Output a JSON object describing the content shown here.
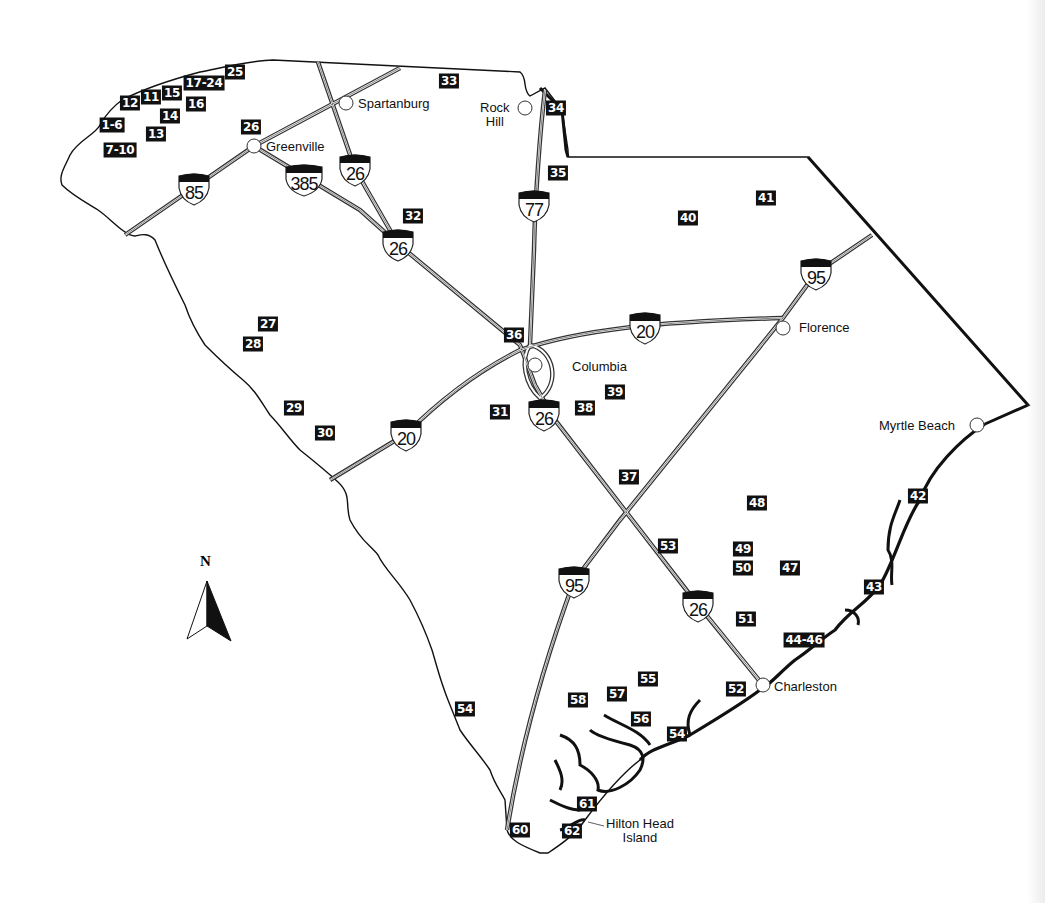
{
  "map": {
    "title": "South Carolina",
    "north_label": "N",
    "colors": {
      "marker_bg": "#111111",
      "marker_text": "#ffffff",
      "border": "#111111",
      "road": "#333333"
    },
    "cities": [
      {
        "name": "Spartanburg",
        "x": 346,
        "y": 103,
        "label_x": 358,
        "label_y": 97
      },
      {
        "name": "Rock Hill",
        "x": 525,
        "y": 108,
        "label_x": 478,
        "label_y": 101,
        "lines": [
          "Rock",
          "Hill"
        ]
      },
      {
        "name": "Greenville",
        "x": 254,
        "y": 146,
        "label_x": 266,
        "label_y": 140
      },
      {
        "name": "Florence",
        "x": 783,
        "y": 328,
        "label_x": 799,
        "label_y": 321
      },
      {
        "name": "Columbia",
        "x": 535,
        "y": 365,
        "label_x": 572,
        "label_y": 360
      },
      {
        "name": "Myrtle Beach",
        "x": 977,
        "y": 425,
        "label_x": 879,
        "label_y": 419
      },
      {
        "name": "Charleston",
        "x": 763,
        "y": 685,
        "label_x": 774,
        "label_y": 680
      },
      {
        "name": "Hilton Head Island",
        "x": 0,
        "y": 0,
        "label_x": 605,
        "label_y": 818,
        "lines": [
          "Hilton Head",
          "Island"
        ]
      }
    ],
    "interstates": [
      {
        "number": "85",
        "x": 194,
        "y": 188
      },
      {
        "number": "385",
        "x": 304,
        "y": 179
      },
      {
        "number": "26",
        "x": 355,
        "y": 169
      },
      {
        "number": "26",
        "x": 398,
        "y": 244
      },
      {
        "number": "77",
        "x": 534,
        "y": 205
      },
      {
        "number": "95",
        "x": 816,
        "y": 273
      },
      {
        "number": "20",
        "x": 645,
        "y": 327
      },
      {
        "number": "26",
        "x": 544,
        "y": 414
      },
      {
        "number": "20",
        "x": 406,
        "y": 434
      },
      {
        "number": "95",
        "x": 574,
        "y": 581
      },
      {
        "number": "26",
        "x": 698,
        "y": 605
      }
    ],
    "markers": [
      {
        "label": "25",
        "x": 235,
        "y": 72
      },
      {
        "label": "17-24",
        "x": 204,
        "y": 83
      },
      {
        "label": "15",
        "x": 172,
        "y": 93
      },
      {
        "label": "11",
        "x": 151,
        "y": 97
      },
      {
        "label": "12",
        "x": 130,
        "y": 103
      },
      {
        "label": "16",
        "x": 196,
        "y": 104
      },
      {
        "label": "14",
        "x": 170,
        "y": 116
      },
      {
        "label": "1-6",
        "x": 112,
        "y": 125
      },
      {
        "label": "13",
        "x": 156,
        "y": 134
      },
      {
        "label": "7-10",
        "x": 120,
        "y": 150
      },
      {
        "label": "26",
        "x": 251,
        "y": 127
      },
      {
        "label": "33",
        "x": 449,
        "y": 81
      },
      {
        "label": "34",
        "x": 556,
        "y": 108
      },
      {
        "label": "35",
        "x": 558,
        "y": 173
      },
      {
        "label": "32",
        "x": 413,
        "y": 216
      },
      {
        "label": "41",
        "x": 766,
        "y": 198
      },
      {
        "label": "40",
        "x": 688,
        "y": 218
      },
      {
        "label": "27",
        "x": 268,
        "y": 324
      },
      {
        "label": "28",
        "x": 253,
        "y": 344
      },
      {
        "label": "36",
        "x": 514,
        "y": 335
      },
      {
        "label": "39",
        "x": 615,
        "y": 392
      },
      {
        "label": "38",
        "x": 585,
        "y": 408
      },
      {
        "label": "31",
        "x": 500,
        "y": 412
      },
      {
        "label": "29",
        "x": 294,
        "y": 408
      },
      {
        "label": "30",
        "x": 325,
        "y": 433
      },
      {
        "label": "37",
        "x": 629,
        "y": 477
      },
      {
        "label": "48",
        "x": 757,
        "y": 503
      },
      {
        "label": "42",
        "x": 918,
        "y": 496
      },
      {
        "label": "53",
        "x": 668,
        "y": 546
      },
      {
        "label": "49",
        "x": 743,
        "y": 549
      },
      {
        "label": "50",
        "x": 743,
        "y": 568
      },
      {
        "label": "47",
        "x": 790,
        "y": 568
      },
      {
        "label": "43",
        "x": 874,
        "y": 587
      },
      {
        "label": "51",
        "x": 746,
        "y": 619
      },
      {
        "label": "44-46",
        "x": 804,
        "y": 640
      },
      {
        "label": "55",
        "x": 648,
        "y": 679
      },
      {
        "label": "52",
        "x": 736,
        "y": 689
      },
      {
        "label": "57",
        "x": 617,
        "y": 694
      },
      {
        "label": "58",
        "x": 578,
        "y": 700
      },
      {
        "label": "56",
        "x": 641,
        "y": 719
      },
      {
        "label": "54",
        "x": 677,
        "y": 734
      },
      {
        "label": "54",
        "x": 465,
        "y": 709
      },
      {
        "label": "61",
        "x": 587,
        "y": 804
      },
      {
        "label": "60",
        "x": 520,
        "y": 830
      },
      {
        "label": "62",
        "x": 572,
        "y": 831
      }
    ]
  }
}
